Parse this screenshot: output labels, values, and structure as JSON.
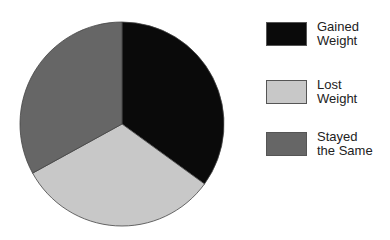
{
  "chart_data": {
    "type": "pie",
    "title": "",
    "categories": [
      "Gained Weight",
      "Lost Weight",
      "Stayed the Same"
    ],
    "values": [
      35,
      32,
      33
    ],
    "unit": "percent (estimated from slice angles)",
    "colors": [
      "#0a0a0a",
      "#c8c8c8",
      "#666666"
    ],
    "start_angle": "12 o'clock, clockwise",
    "legend_position": "right"
  },
  "legend": {
    "items": [
      {
        "line1": "Gained",
        "line2": "Weight",
        "color": "#0a0a0a"
      },
      {
        "line1": "Lost",
        "line2": "Weight",
        "color": "#c8c8c8"
      },
      {
        "line1": "Stayed",
        "line2": "the Same",
        "color": "#666666"
      }
    ]
  }
}
